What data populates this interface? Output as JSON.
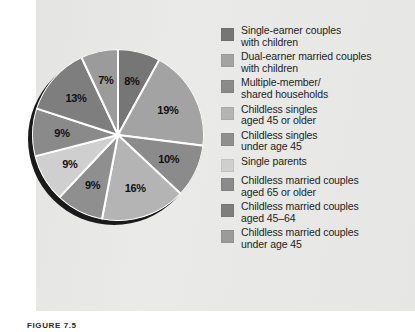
{
  "figure": {
    "caption": "FIGURE 7.5",
    "background_color": "#e8e8e6"
  },
  "chart_data": {
    "type": "pie",
    "title": "",
    "start_angle_deg": 0,
    "direction": "clockwise",
    "legend_position": "right",
    "grid": false,
    "categories": [
      "Single-earner couples with children",
      "Dual-earner married couples with children",
      "Multiple-member/ shared households",
      "Childless singles aged 45 or older",
      "Childless singles under age 45",
      "Single parents",
      "Childless married couples aged 65 or older",
      "Childless married couples aged 45–64",
      "Childless married couples under age 45"
    ],
    "values": [
      8,
      19,
      10,
      16,
      9,
      9,
      9,
      13,
      7
    ],
    "value_labels": [
      "8%",
      "19%",
      "10%",
      "16%",
      "9%",
      "9%",
      "9%",
      "13%",
      "7%"
    ],
    "colors": [
      "#767676",
      "#a3a3a3",
      "#8b8b8b",
      "#b4b4b4",
      "#8f8f8f",
      "#cfcfcf",
      "#8a8a8a",
      "#7e7e7e",
      "#9b9b9b"
    ]
  },
  "slices": [
    {
      "label": "8%",
      "value": 8,
      "color": "#767676",
      "lx": 53,
      "ly": 14
    },
    {
      "label": "19%",
      "value": 19,
      "color": "#a3a3a3",
      "lx": 76,
      "ly": 39
    },
    {
      "label": "10%",
      "value": 10,
      "color": "#8b8b8b",
      "lx": 79,
      "ly": 78
    },
    {
      "label": "16%",
      "value": 16,
      "color": "#b4b4b4",
      "lx": 53,
      "ly": 101
    },
    {
      "label": "9%",
      "value": 9,
      "color": "#8f8f8f",
      "lx": 24,
      "ly": 100
    },
    {
      "label": "9%",
      "value": 9,
      "color": "#cfcfcf",
      "lx": 8,
      "ly": 83
    },
    {
      "label": "9%",
      "value": 9,
      "color": "#8a8a8a",
      "lx": 0,
      "ly": 62
    },
    {
      "label": "13%",
      "value": 13,
      "color": "#7e7e7e",
      "lx": 8,
      "ly": 34
    },
    {
      "label": "7%",
      "value": 7,
      "color": "#9b9b9b",
      "lx": 33,
      "ly": 15
    }
  ],
  "legend": {
    "items": [
      {
        "color": "#767676",
        "lines": [
          "Single-earner couples",
          "with children"
        ]
      },
      {
        "color": "#a3a3a3",
        "lines": [
          "Dual-earner married couples",
          "with children"
        ]
      },
      {
        "color": "#8b8b8b",
        "lines": [
          "Multiple-member/",
          "shared households"
        ]
      },
      {
        "color": "#b4b4b4",
        "lines": [
          "Childless singles",
          "aged 45 or older"
        ]
      },
      {
        "color": "#8f8f8f",
        "lines": [
          "Childless singles",
          "under age 45"
        ]
      },
      {
        "color": "#cfcfcf",
        "lines": [
          "Single parents"
        ]
      },
      {
        "color": "#8a8a8a",
        "lines": [
          "Childless married couples",
          "aged 65 or older"
        ]
      },
      {
        "color": "#7e7e7e",
        "lines": [
          "Childless married couples",
          "aged 45–64"
        ]
      },
      {
        "color": "#9b9b9b",
        "lines": [
          "Childless married couples",
          "under age 45"
        ]
      }
    ]
  }
}
